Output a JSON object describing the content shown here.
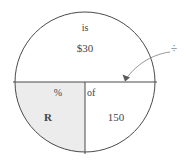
{
  "diagram": {
    "type": "percent-circle",
    "shape": "circle",
    "segments": [
      {
        "id": "top-half",
        "name": "amount-half",
        "position": "top",
        "shaded": false,
        "labels": [
          "is",
          "$30"
        ]
      },
      {
        "id": "bottom-left-quadrant",
        "name": "rate-quadrant",
        "position": "bottom-left",
        "shaded": true,
        "shade_color": "#ececec",
        "labels": [
          "%",
          "R"
        ]
      },
      {
        "id": "bottom-right-quadrant",
        "name": "base-quadrant",
        "position": "bottom-right",
        "shaded": false,
        "labels": [
          "of",
          "150"
        ]
      }
    ],
    "text": {
      "is_label": "is",
      "amount_value": "$30",
      "percent_symbol": "%",
      "rate_variable": "R",
      "of_label": "of",
      "base_value": "150"
    },
    "annotation": {
      "operator_symbol": "÷",
      "operator_name": "division-sign",
      "points_to": "horizontal-diameter",
      "arrow": "curved-arrow"
    },
    "colors": {
      "stroke": "#4a4a4a",
      "shade": "#ececec",
      "text": "#444444",
      "background": "#ffffff"
    }
  }
}
